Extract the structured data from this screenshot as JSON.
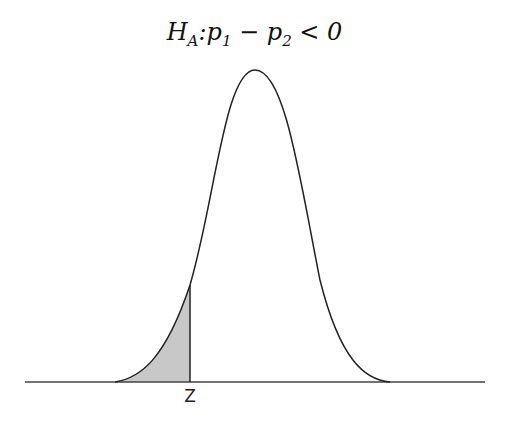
{
  "title": {
    "H": "H",
    "sub_A": "A",
    "colon": ":",
    "p1": "p",
    "sub_1": "1",
    "minus": " − ",
    "p2": "p",
    "sub_2": "2",
    "rel": " < ",
    "zero": "0"
  },
  "diagram": {
    "type": "normal-distribution-left-tail",
    "critical_label": "Z",
    "shaded_region": "left tail",
    "colors": {
      "curve": "#222222",
      "shade": "#c8c8c8",
      "axis": "#444444"
    }
  }
}
